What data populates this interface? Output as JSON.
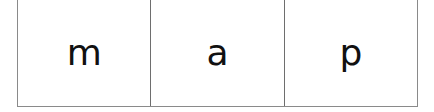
{
  "cells": [
    {
      "letter": "m"
    },
    {
      "letter": "a"
    },
    {
      "letter": "p"
    }
  ]
}
